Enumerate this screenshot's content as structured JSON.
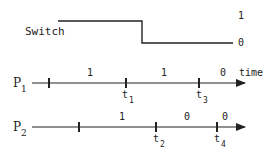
{
  "switch": {
    "label": "Switch",
    "high_label": "1",
    "low_label": "0"
  },
  "p1": {
    "label": "P",
    "subscript": "1",
    "axis_label": "time",
    "segments": [
      "1",
      "1",
      "0"
    ],
    "ticks": [
      "",
      "t",
      "t"
    ],
    "tick_subs": [
      "",
      "1",
      "3"
    ]
  },
  "p2": {
    "label": "P",
    "subscript": "2",
    "segments": [
      "1",
      "0",
      "0"
    ],
    "ticks": [
      "",
      "t",
      "t"
    ],
    "tick_subs": [
      "",
      "2",
      "4"
    ]
  },
  "colors": {
    "line": "#222222",
    "background": "#ffffff"
  }
}
